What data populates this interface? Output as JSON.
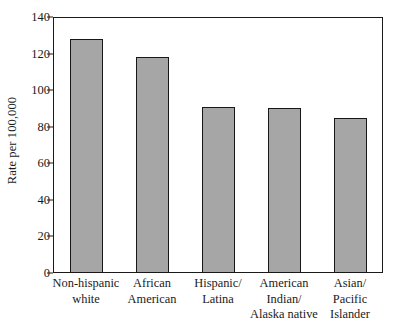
{
  "chart_data": {
    "type": "bar",
    "title": "",
    "xlabel": "",
    "ylabel": "Rate per 100,000",
    "ylim": [
      0,
      140
    ],
    "yticks": [
      0,
      20,
      40,
      60,
      80,
      100,
      120,
      140
    ],
    "ytick_labels": [
      "0",
      "20",
      "40",
      "60",
      "80",
      "100",
      "120",
      "140"
    ],
    "grid": false,
    "legend": "none",
    "bar_fill_color": "#a6a6a6",
    "bar_edge_color": "#171717",
    "categories": [
      "Non-hispanic white",
      "African American",
      "Hispanic/ Latina",
      "American Indian/ Alaska native",
      "Asian/ Pacific Islander"
    ],
    "category_label_lines": [
      [
        "Non-hispanic",
        "white"
      ],
      [
        "African",
        "American"
      ],
      [
        "Hispanic/",
        "Latina"
      ],
      [
        "American",
        "Indian/",
        "Alaska native"
      ],
      [
        "Asian/",
        "Pacific",
        "Islander"
      ]
    ],
    "values": [
      128,
      118,
      91,
      90.5,
      85
    ]
  }
}
